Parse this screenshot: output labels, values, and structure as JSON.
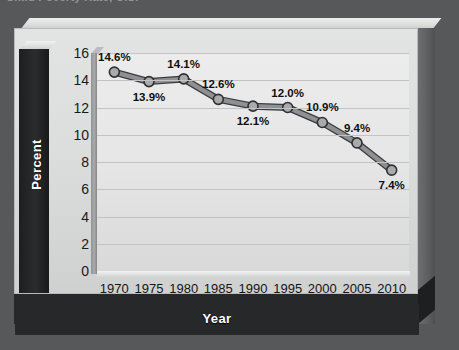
{
  "top_caption": "Child Poverty Rate, U.S.",
  "axis": {
    "y_title": "Percent",
    "x_title": "Year",
    "y_ticks": [
      0,
      2,
      4,
      6,
      8,
      10,
      12,
      14,
      16
    ],
    "x_ticks": [
      "1970",
      "1975",
      "1980",
      "1985",
      "1990",
      "1995",
      "2000",
      "2005",
      "2010"
    ]
  },
  "colors": {
    "background": "#56585a",
    "panel": "#dcdddd",
    "plot": "#e8e8e8",
    "gridline": "#c2c3c3",
    "line": "#8e9093",
    "line_outline": "#3a3c3e",
    "marker_fill": "#a8aaac",
    "marker_outline": "#2e3032",
    "dark_band": "#26282a",
    "label_text": "#101010"
  },
  "chart_data": {
    "type": "line",
    "title": "Child Poverty Rate, U.S.",
    "xlabel": "Year",
    "ylabel": "Percent",
    "categories": [
      "1970",
      "1975",
      "1980",
      "1985",
      "1990",
      "1995",
      "2000",
      "2005",
      "2010"
    ],
    "values": [
      14.6,
      13.9,
      14.1,
      12.6,
      12.1,
      12.0,
      10.9,
      9.4,
      7.4
    ],
    "data_labels": [
      "14.6%",
      "13.9%",
      "14.1%",
      "12.6%",
      "12.1%",
      "12.0%",
      "10.9%",
      "9.4%",
      "7.4%"
    ],
    "label_positions": [
      "above",
      "below",
      "above",
      "above",
      "below",
      "above",
      "above",
      "above",
      "below"
    ],
    "ylim": [
      0,
      16
    ],
    "ytick_step": 2,
    "grid": true,
    "legend": "none",
    "marker": "circle"
  }
}
